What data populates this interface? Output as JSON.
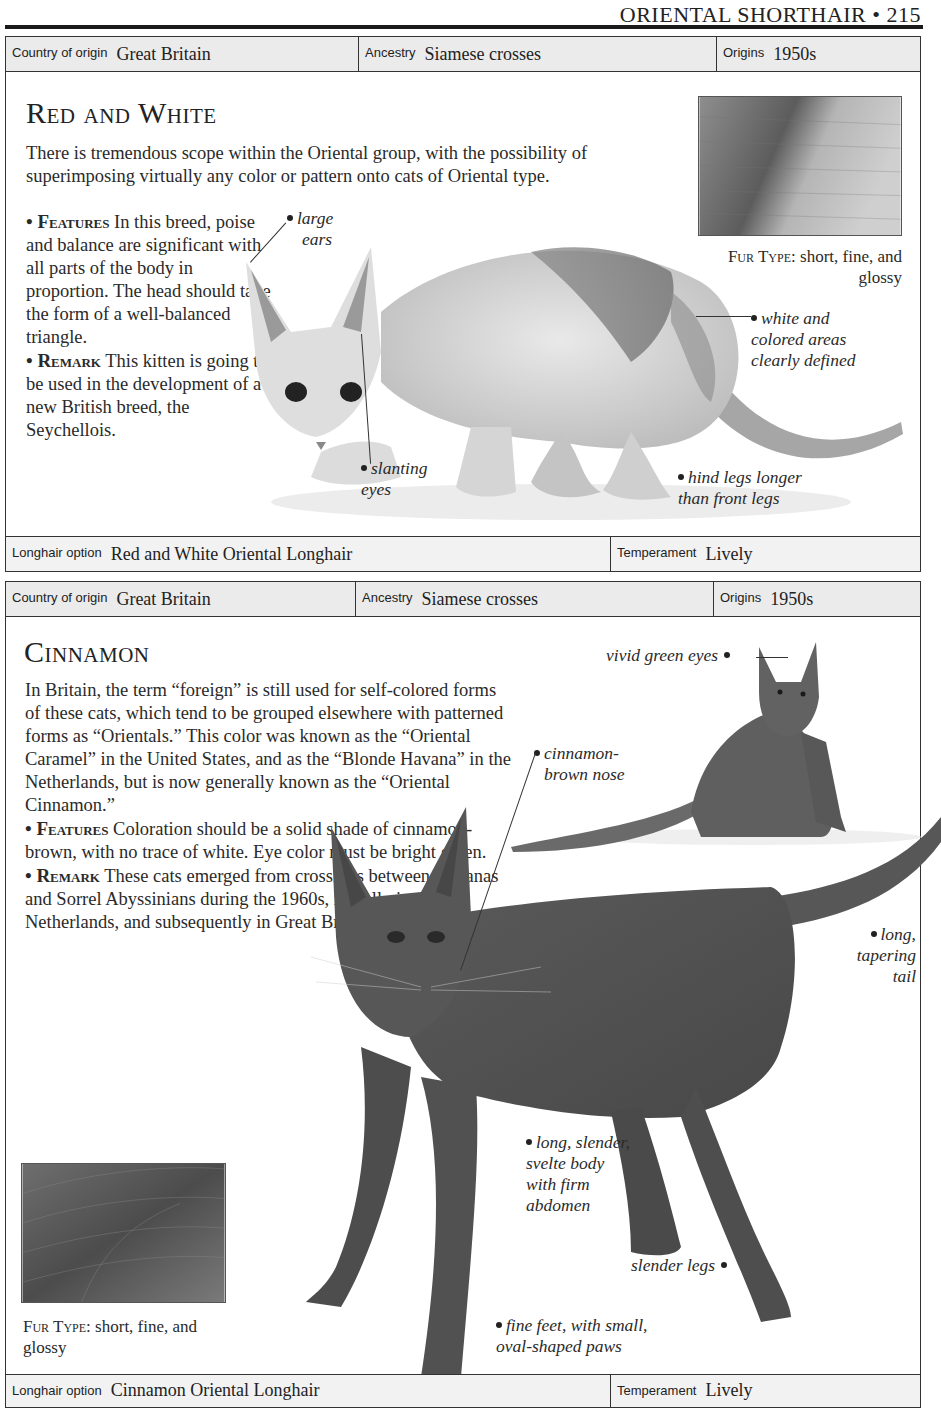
{
  "page": {
    "running_head": "ORIENTAL SHORTHAIR • 215"
  },
  "entries": [
    {
      "info_top": {
        "country_label": "Country of origin",
        "country_value": "Great Britain",
        "ancestry_label": "Ancestry",
        "ancestry_value": "Siamese crosses",
        "origins_label": "Origins",
        "origins_value": "1950s"
      },
      "title": "Red and White",
      "intro": "There is tremendous scope within the Oriental group, with the possibility of superimposing virtually any color or pattern onto cats of Oriental type.",
      "features_label": "• Features",
      "features_text": "In this breed, poise and balance are significant with all parts of the body in proportion. The head should take the form of a well-balanced triangle.",
      "remark_label": "• Remark",
      "remark_text": "This kitten is going to be used in the development of a new British breed, the Seychellois.",
      "fur_type_label": "Fur Type:",
      "fur_type_value": "short, fine, and glossy",
      "callouts": {
        "ears": [
          "large",
          "ears"
        ],
        "areas": [
          "white and",
          "colored areas",
          "clearly defined"
        ],
        "eyes": [
          "slanting",
          "eyes"
        ],
        "legs": [
          "hind legs longer",
          "than front legs"
        ]
      },
      "info_bottom": {
        "longhair_label": "Longhair option",
        "longhair_value": "Red and White Oriental Longhair",
        "temperament_label": "Temperament",
        "temperament_value": "Lively"
      }
    },
    {
      "info_top": {
        "country_label": "Country of origin",
        "country_value": "Great Britain",
        "ancestry_label": "Ancestry",
        "ancestry_value": "Siamese crosses",
        "origins_label": "Origins",
        "origins_value": "1950s"
      },
      "title": "Cinnamon",
      "intro": "In Britain, the term “foreign” is still used for self-colored forms of these cats, which tend to be grouped elsewhere with patterned forms as “Orientals.” This color was known as the “Oriental Caramel” in the United States, and as the “Blonde Havana” in the Netherlands, but is now generally known as the “Oriental Cinnamon.”",
      "features_label": "• Features",
      "features_text": "Coloration should be a solid shade of cinnamon-brown, with no trace of white. Eye color must be bright green.",
      "remark_label": "• Remark",
      "remark_text": "These cats emerged from crossings between Havanas and Sorrel Abyssinians during the 1960s, initially in the Netherlands, and subsequently in Great Britain.",
      "fur_type_label": "Fur Type:",
      "fur_type_value": "short, fine, and glossy",
      "callouts": {
        "eyes": "vivid green eyes",
        "nose": [
          "cinnamon-",
          "brown nose"
        ],
        "tail": [
          "long,",
          "tapering",
          "tail"
        ],
        "body": [
          "long, slender,",
          "svelte body",
          "with firm",
          "abdomen"
        ],
        "legs": "slender legs",
        "feet": [
          "fine feet, with small,",
          "oval-shaped paws"
        ]
      },
      "info_bottom": {
        "longhair_label": "Longhair option",
        "longhair_value": "Cinnamon Oriental Longhair",
        "temperament_label": "Temperament",
        "temperament_value": "Lively"
      }
    }
  ]
}
